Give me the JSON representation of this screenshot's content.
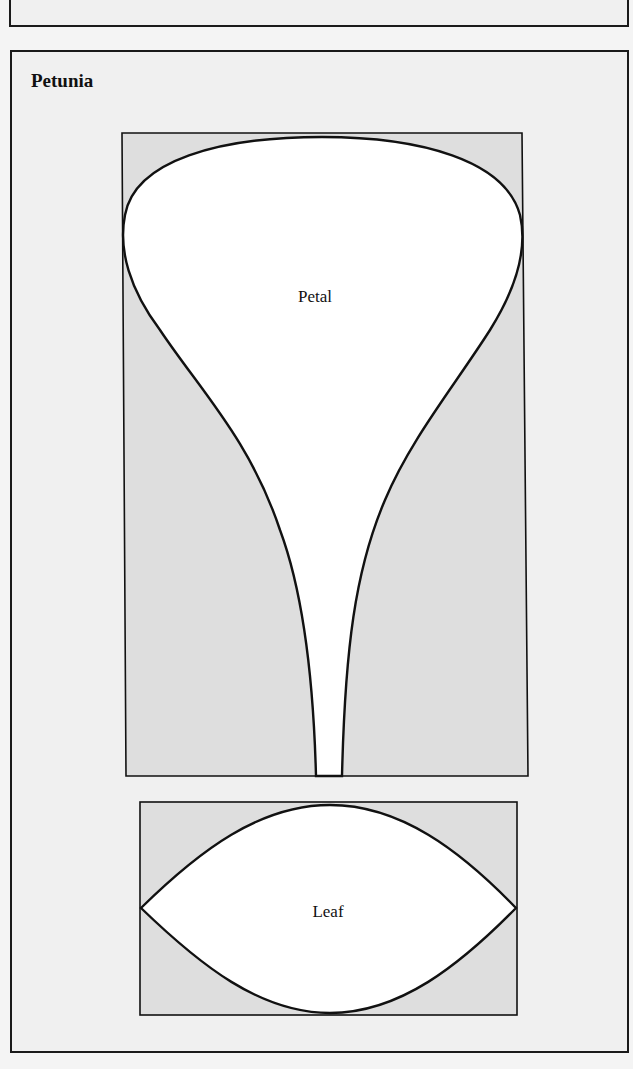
{
  "title": "Petunia",
  "diagrams": [
    {
      "name": "petal",
      "label": "Petal"
    },
    {
      "name": "leaf",
      "label": "Leaf"
    }
  ],
  "colors": {
    "background": "#f0f0f0",
    "box_fill": "#dedede",
    "shape_fill": "#ffffff",
    "stroke": "#111111"
  }
}
